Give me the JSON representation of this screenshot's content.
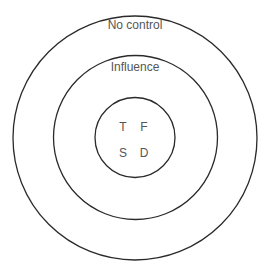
{
  "diagram": {
    "type": "concentric-circles",
    "stroke_color": "#2a2a2a",
    "text_color": "#555555",
    "rings": [
      {
        "id": "outer",
        "label": "No control"
      },
      {
        "id": "middle",
        "label": "Influence"
      },
      {
        "id": "inner",
        "label": ""
      }
    ],
    "inner_letters": [
      "T",
      "F",
      "S",
      "D"
    ]
  }
}
